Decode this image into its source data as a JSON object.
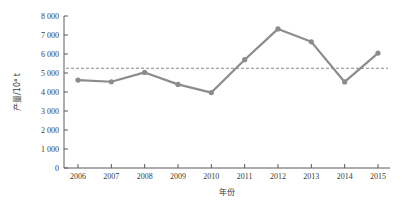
{
  "chart_data": {
    "type": "line",
    "title": "",
    "subtitle": "",
    "xlabel": "年份",
    "ylabel": "产量/10⁴ t",
    "categories": [
      "2006",
      "2007",
      "2008",
      "2009",
      "2010",
      "2011",
      "2012",
      "2013",
      "2014",
      "2015"
    ],
    "x": [
      2006,
      2007,
      2008,
      2009,
      2010,
      2011,
      2012,
      2013,
      2014,
      2015
    ],
    "series": [
      {
        "name": "产量",
        "values": [
          4630,
          4540,
          5030,
          4400,
          3970,
          5700,
          7320,
          6640,
          4530,
          6050
        ],
        "color": "#8c8c8c",
        "marker": "circle"
      }
    ],
    "annotations": [
      {
        "type": "hline",
        "name": "average-reference-line",
        "value": 5250,
        "style": "dashed",
        "color": "#7a7a7a"
      }
    ],
    "ylim": [
      0,
      8000
    ],
    "ytick_values": [
      0,
      1000,
      2000,
      3000,
      4000,
      5000,
      6000,
      7000,
      8000
    ],
    "ytick_labels": [
      "0",
      "1 000",
      "2 000",
      "3 000",
      "4 000",
      "5 000",
      "6 000",
      "7 000",
      "8 000"
    ],
    "xtick_labels": [
      "2006",
      "2007",
      "2008",
      "2009",
      "2010",
      "2011",
      "2012",
      "2013",
      "2014",
      "2015"
    ],
    "grid": false,
    "legend": false,
    "legend_position": "none",
    "axis_color": "#5a5a5a",
    "text_color": "#3b3b3b",
    "background": "#ffffff"
  }
}
